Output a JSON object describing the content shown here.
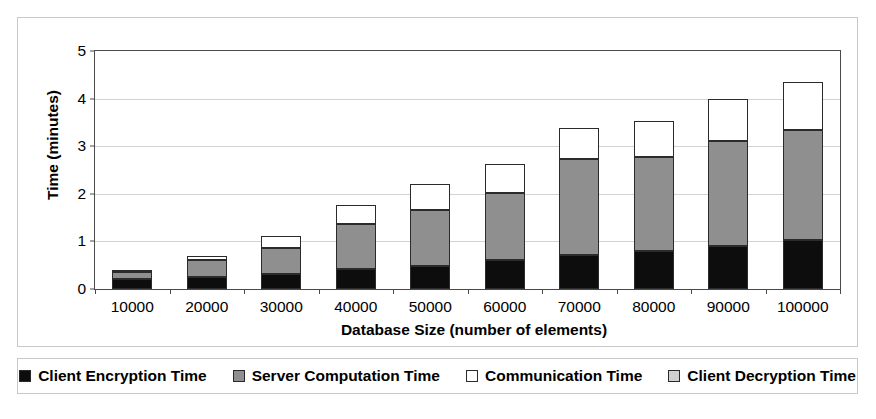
{
  "chart_data": {
    "type": "bar",
    "subtype": "stacked",
    "title": "",
    "xlabel": "Database Size (number of elements)",
    "ylabel": "Time (minutes)",
    "categories": [
      "10000",
      "20000",
      "30000",
      "40000",
      "50000",
      "60000",
      "70000",
      "80000",
      "90000",
      "100000"
    ],
    "ylim": [
      0,
      5
    ],
    "yticks": [
      0,
      1,
      2,
      3,
      4,
      5
    ],
    "ytick_labels": [
      "0",
      "1",
      "2",
      "3",
      "4",
      "5"
    ],
    "grid": true,
    "legend_position": "bottom",
    "series": [
      {
        "name": "Client Encryption Time",
        "color": "#0d0d0d",
        "values": [
          0.21,
          0.26,
          0.31,
          0.42,
          0.49,
          0.61,
          0.72,
          0.79,
          0.91,
          1.02
        ]
      },
      {
        "name": "Server Computation Time",
        "color": "#8f8f8f",
        "values": [
          0.15,
          0.36,
          0.55,
          0.94,
          1.17,
          1.41,
          2.01,
          1.98,
          2.21,
          2.33
        ]
      },
      {
        "name": "Communication Time",
        "color": "#ffffff",
        "values": [
          0.04,
          0.07,
          0.26,
          0.41,
          0.54,
          0.6,
          0.65,
          0.76,
          0.88,
          1.0
        ]
      },
      {
        "name": "Client Decryption Time",
        "color": "#cfcfcf",
        "values": [
          0.0,
          0.0,
          0.0,
          0.0,
          0.0,
          0.0,
          0.0,
          0.0,
          0.0,
          0.0
        ]
      }
    ],
    "totals": [
      0.4,
      0.69,
      1.12,
      1.77,
      2.2,
      2.62,
      3.38,
      3.53,
      4.0,
      4.35
    ]
  },
  "legend": {
    "items": [
      {
        "label": "Client Encryption Time",
        "color": "#0d0d0d"
      },
      {
        "label": "Server Computation Time",
        "color": "#8f8f8f"
      },
      {
        "label": "Communication Time",
        "color": "#ffffff"
      },
      {
        "label": "Client Decryption Time",
        "color": "#cfcfcf"
      }
    ]
  },
  "colors": {
    "frame_border": "#c9c9c9",
    "axis": "#4a4a4a",
    "gridline": "#d2d2d2",
    "background": "#ffffff",
    "text": "#000000"
  }
}
